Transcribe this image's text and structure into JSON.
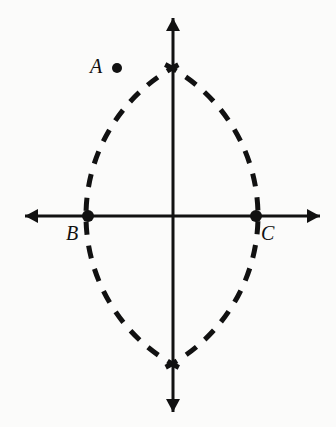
{
  "figure": {
    "background_color": "#fbfbfa",
    "ink_color": "#111111",
    "width": 336,
    "height": 427
  },
  "labels": {
    "a": "A",
    "b": "B",
    "c": "C"
  },
  "points": [
    {
      "name": "A",
      "label": "A",
      "x": 117,
      "y": 68,
      "marker": "filled-dot",
      "radius": 5,
      "on_axis": false
    },
    {
      "name": "B",
      "label": "B",
      "x": 88,
      "y": 216,
      "marker": "filled-dot",
      "radius": 6,
      "on_axis": true
    },
    {
      "name": "C",
      "label": "C",
      "x": 256,
      "y": 216,
      "marker": "filled-dot",
      "radius": 6,
      "on_axis": true
    }
  ],
  "axes": {
    "horizontal": {
      "name": "horizontal-axis",
      "y": 216,
      "x_start": 25,
      "x_end": 320,
      "arrows": "both",
      "stroke_width": 3
    },
    "vertical": {
      "name": "vertical-axis",
      "x": 173,
      "y_start": 18,
      "y_end": 412,
      "arrows": "both",
      "stroke_width": 3
    }
  },
  "arcs": [
    {
      "name": "arc-centered-at-B",
      "center_x": 88,
      "center_y": 216,
      "radius": 170,
      "style": "dashed",
      "stroke_width": 5,
      "dash_length": 13,
      "gap_length": 11,
      "start_angle_deg": -63,
      "end_angle_deg": 63
    },
    {
      "name": "arc-centered-at-C",
      "center_x": 256,
      "center_y": 216,
      "radius": 170,
      "style": "dashed",
      "stroke_width": 5,
      "dash_length": 13,
      "gap_length": 11,
      "start_angle_deg": 117,
      "end_angle_deg": 243
    }
  ],
  "intersections": [
    {
      "name": "top-arc-intersection",
      "x": 173,
      "y": 63
    },
    {
      "name": "bottom-arc-intersection",
      "x": 173,
      "y": 370
    }
  ]
}
